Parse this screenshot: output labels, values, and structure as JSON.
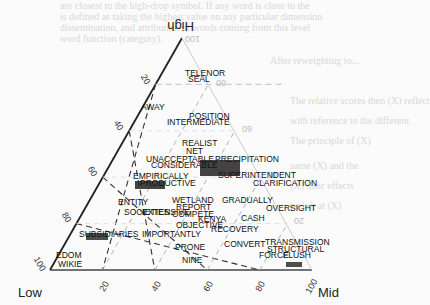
{
  "chart_data": {
    "type": "scatter",
    "subtype": "ternary",
    "title": "",
    "corners": {
      "top": "High",
      "left": "Low",
      "right": "Mid"
    },
    "axis_ticks": {
      "left_edge": [
        "20",
        "40",
        "60",
        "80",
        "100"
      ],
      "bottom_edge": [
        "20",
        "40",
        "60",
        "80",
        "100"
      ],
      "right_edge": [
        "100",
        "80",
        "60",
        "40",
        "20"
      ]
    },
    "grid": true,
    "points": [
      {
        "label": "TELENOR",
        "x": 185,
        "y": 76
      },
      {
        "label": "SEAL",
        "x": 188,
        "y": 82
      },
      {
        "label": "AWAY",
        "x": 141,
        "y": 110
      },
      {
        "label": "POSITION",
        "x": 189,
        "y": 119
      },
      {
        "label": "INTERMEDIATE",
        "x": 167,
        "y": 125
      },
      {
        "label": "REALIST",
        "x": 182,
        "y": 146
      },
      {
        "label": "NET",
        "x": 186,
        "y": 154
      },
      {
        "label": "UNACCEPTABLE",
        "x": 146,
        "y": 162
      },
      {
        "label": "CONSIDERABLE",
        "x": 151,
        "y": 168
      },
      {
        "label": "PRECIPITATION",
        "x": 215,
        "y": 162
      },
      {
        "label": "SUPERINTENDENT",
        "x": 218,
        "y": 178
      },
      {
        "label": "EMPIRICALLY",
        "x": 133,
        "y": 179
      },
      {
        "label": "PRODUCTIVE",
        "x": 140,
        "y": 186
      },
      {
        "label": "CLARIFICATION",
        "x": 253,
        "y": 186
      },
      {
        "label": "ENTITY",
        "x": 118,
        "y": 205
      },
      {
        "label": "WETLAND",
        "x": 172,
        "y": 203
      },
      {
        "label": "GRADUALLY",
        "x": 222,
        "y": 203
      },
      {
        "label": "REPORT",
        "x": 176,
        "y": 210
      },
      {
        "label": "SOCIETIES",
        "x": 124,
        "y": 215
      },
      {
        "label": "EXTENSIVE",
        "x": 142,
        "y": 215
      },
      {
        "label": "COMPETE",
        "x": 172,
        "y": 217
      },
      {
        "label": "KENYA",
        "x": 198,
        "y": 222
      },
      {
        "label": "OVERSIGHT",
        "x": 266,
        "y": 211
      },
      {
        "label": "CASH",
        "x": 241,
        "y": 221
      },
      {
        "label": "OBJECTIVE",
        "x": 176,
        "y": 228
      },
      {
        "label": "RECOVERY",
        "x": 211,
        "y": 232
      },
      {
        "label": "SUBSIDIARIES",
        "x": 79,
        "y": 237
      },
      {
        "label": "IMPORTANTLY",
        "x": 142,
        "y": 237
      },
      {
        "label": "CONVERT",
        "x": 224,
        "y": 247
      },
      {
        "label": "TRANSMISSION",
        "x": 265,
        "y": 245
      },
      {
        "label": "STRUCTURAL",
        "x": 267,
        "y": 252
      },
      {
        "label": "PRONE",
        "x": 175,
        "y": 250
      },
      {
        "label": "FORCE",
        "x": 259,
        "y": 258
      },
      {
        "label": "FLUSH",
        "x": 283,
        "y": 258
      },
      {
        "label": "NINE",
        "x": 182,
        "y": 263
      },
      {
        "label": "EDOM",
        "x": 56,
        "y": 258
      },
      {
        "label": "WIKIE",
        "x": 58,
        "y": 267
      }
    ]
  },
  "background_text": [
    "are closest to the high-drop symbol. If any word is close to the",
    "is defined as taking the highest value on any particular dimension",
    "dissemination, and attribution of words coming from this level",
    "word function (category).",
    "After reweighting to...",
    "The relative scores then (X) reflect",
    "with reference to the different",
    "The principle of (X)",
    "same (X) and the",
    "(X) their effects",
    "be left at (X)"
  ]
}
